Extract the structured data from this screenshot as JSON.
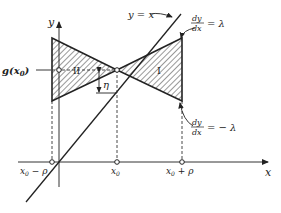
{
  "diagram": {
    "axes": {
      "x_label": "x",
      "y_label": "y"
    },
    "line_label": "y = x",
    "left_point_label": "g(x",
    "left_point_sub": "0",
    "left_point_close": ")",
    "region_labels": [
      "II",
      "I"
    ],
    "eta_label": "η",
    "slope_pos": {
      "num": "dy",
      "den": "dx",
      "rhs": "= λ"
    },
    "slope_neg": {
      "num": "dy",
      "den": "dx",
      "rhs": "= − λ"
    },
    "x_ticks": [
      {
        "main": "x",
        "sub": "0",
        "rest": " − ρ"
      },
      {
        "main": "x",
        "sub": "0",
        "rest": ""
      },
      {
        "main": "x",
        "sub": "0",
        "rest": " + ρ"
      }
    ],
    "colors": {
      "ink": "#222222",
      "background": "#ffffff"
    }
  }
}
